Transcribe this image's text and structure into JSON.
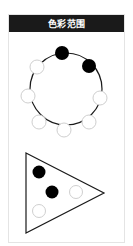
{
  "header": {
    "title": "色彩范围"
  },
  "colors": {
    "header_bg": "#1a1a1a",
    "dot_filled": "#000000",
    "dot_empty": "#ffffff",
    "dot_empty_stroke": "#cfcfcf",
    "line": "#1a1a1a"
  },
  "circle_diagram": {
    "shape": "circle",
    "dots": [
      {
        "position": "top",
        "filled": true
      },
      {
        "position": "upper-right",
        "filled": true
      },
      {
        "position": "right",
        "filled": false
      },
      {
        "position": "lower-right",
        "filled": false
      },
      {
        "position": "bottom",
        "filled": false
      },
      {
        "position": "lower-left",
        "filled": false
      },
      {
        "position": "left",
        "filled": false
      },
      {
        "position": "upper-left",
        "filled": false
      }
    ]
  },
  "triangle_diagram": {
    "shape": "triangle",
    "dots": [
      {
        "position": "top-left",
        "filled": true
      },
      {
        "position": "center",
        "filled": true
      },
      {
        "position": "center-right",
        "filled": false
      },
      {
        "position": "bottom-left",
        "filled": false
      }
    ]
  }
}
